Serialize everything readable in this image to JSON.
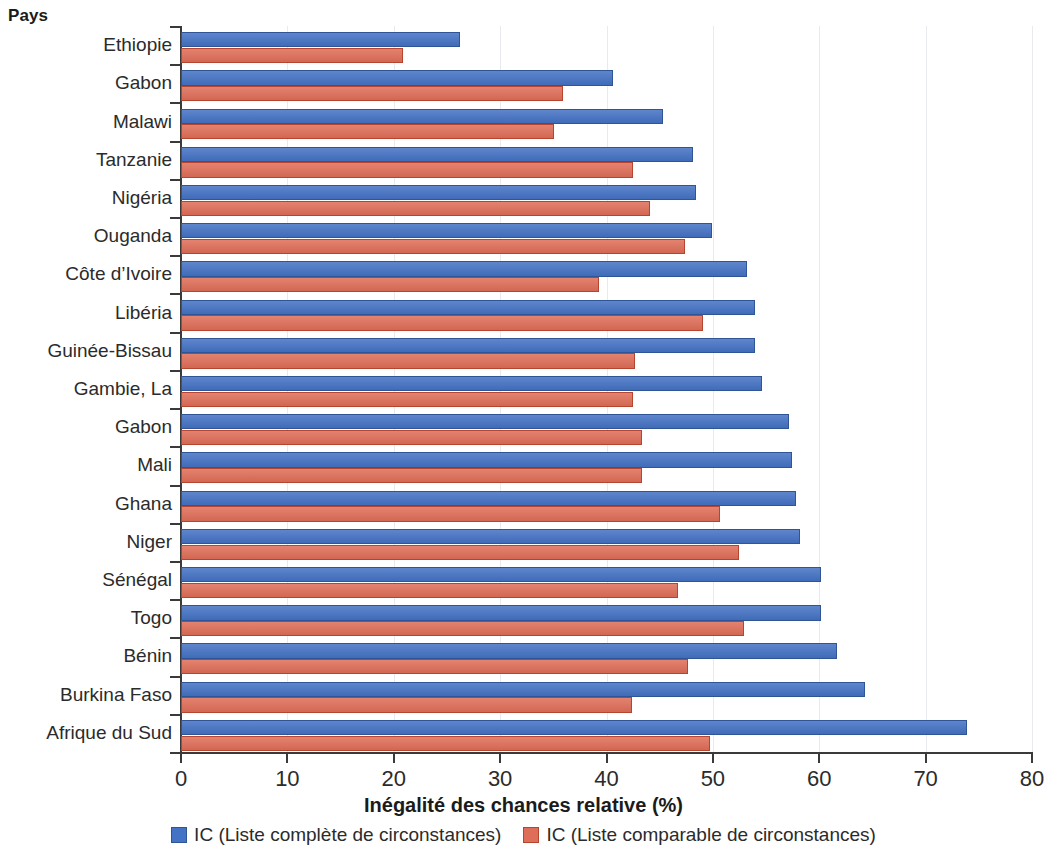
{
  "chart_data": {
    "type": "bar",
    "orientation": "horizontal",
    "title": "",
    "xlabel": "Inégalité des chances relative (%)",
    "ylabel": "Pays",
    "xlim": [
      0,
      80
    ],
    "xticks": [
      "0",
      "10",
      "20",
      "30",
      "40",
      "50",
      "60",
      "70",
      "80"
    ],
    "grid": true,
    "legend_position": "bottom",
    "categories": [
      "Ethiopie",
      "Gabon",
      "Malawi",
      "Tanzanie",
      "Nigéria",
      "Ouganda",
      "Côte d’Ivoire",
      "Libéria",
      "Guinée-Bissau",
      "Gambie, La",
      "Gabon",
      "Mali",
      "Ghana",
      "Niger",
      "Sénégal",
      "Togo",
      "Bénin",
      "Burkina Faso",
      "Afrique du Sud"
    ],
    "series": [
      {
        "name": "IC (Liste complète de circonstances)",
        "color": "#4472c4",
        "values": [
          26.2,
          40.6,
          45.3,
          48.1,
          48.4,
          49.9,
          53.2,
          54.0,
          54.0,
          54.6,
          57.2,
          57.4,
          57.8,
          58.2,
          60.2,
          60.2,
          61.7,
          64.3,
          73.9
        ]
      },
      {
        "name": "IC (Liste comparable de circonstances)",
        "color": "#df6e58",
        "values": [
          20.9,
          35.9,
          35.1,
          42.5,
          44.1,
          47.4,
          39.3,
          49.1,
          42.7,
          42.5,
          43.3,
          43.3,
          50.7,
          52.5,
          46.7,
          52.9,
          47.7,
          42.4,
          49.7
        ]
      }
    ]
  },
  "legend": {
    "items": [
      {
        "label": "IC (Liste complète de circonstances)",
        "color": "#4472c4"
      },
      {
        "label": "IC (Liste comparable de circonstances)",
        "color": "#df6e58"
      }
    ]
  }
}
